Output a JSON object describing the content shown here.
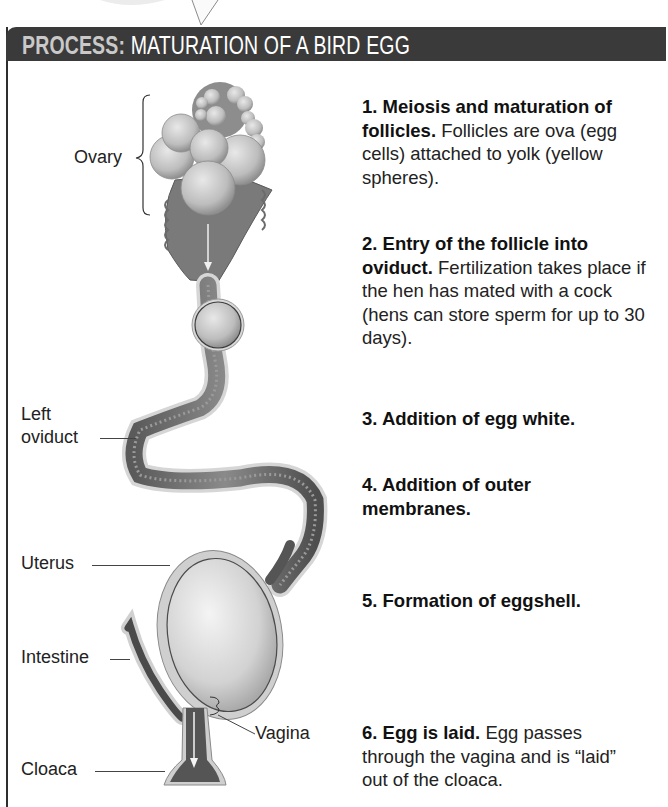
{
  "header": {
    "prefix": "PROCESS:",
    "title": "MATURATION OF A BIRD EGG",
    "bar_color": "#3a3a3a",
    "prefix_color": "#c9c9c9",
    "title_color": "#ffffff"
  },
  "labels": {
    "ovary": "Ovary",
    "left_oviduct_line1": "Left",
    "left_oviduct_line2": "oviduct",
    "uterus": "Uterus",
    "intestine": "Intestine",
    "vagina": "Vagina",
    "cloaca": "Cloaca"
  },
  "steps": [
    {
      "number_title": "1. Meiosis and maturation of follicles.",
      "text": "Follicles are ova (egg cells) attached to yolk (yellow spheres)."
    },
    {
      "number_title": "2. Entry of the follicle into oviduct.",
      "text": "Fertilization takes place if the hen has mated with a cock (hens can store sperm for up to 30 days)."
    },
    {
      "number_title": "3. Addition of egg white.",
      "text": ""
    },
    {
      "number_title": "4. Addition of outer membranes.",
      "text": ""
    },
    {
      "number_title": "5. Formation of eggshell.",
      "text": ""
    },
    {
      "number_title": "6. Egg is laid.",
      "text": "Egg passes through the vagina and is “laid” out of the cloaca."
    }
  ]
}
